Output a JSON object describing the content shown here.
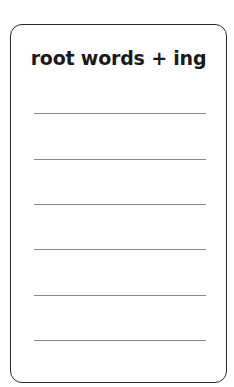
{
  "card": {
    "title": "root words + ing",
    "lines": [
      {
        "index": 1,
        "value": ""
      },
      {
        "index": 2,
        "value": ""
      },
      {
        "index": 3,
        "value": ""
      },
      {
        "index": 4,
        "value": ""
      },
      {
        "index": 5,
        "value": ""
      },
      {
        "index": 6,
        "value": ""
      }
    ]
  }
}
